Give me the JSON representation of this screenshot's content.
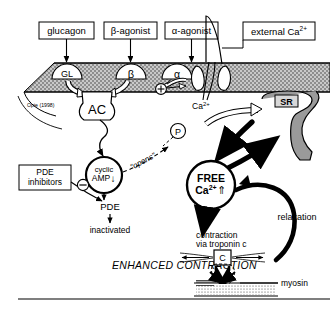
{
  "figure": {
    "title_inline": "ENHANCED CONTRACTION",
    "attribution": "Opie (1998)"
  },
  "ligand_boxes": [
    {
      "label": "glucagon"
    },
    {
      "label": "β-agonist"
    },
    {
      "label": "α-agonist"
    },
    {
      "label": "external Ca2+"
    }
  ],
  "receptors": [
    {
      "label": "GL"
    },
    {
      "label": "β"
    },
    {
      "label": "α"
    }
  ],
  "signs": {
    "plus": "⊕",
    "minus": "⊖"
  },
  "nodes": {
    "adenylate_cyclase": "AC",
    "cyclic_amp_line1": "cyclic",
    "cyclic_amp_line2": "AMP",
    "cyclic_amp_arrow": "↓",
    "phosphate": "P",
    "opens": "\"opens\"",
    "calcium_label": "Ca2+",
    "sr": "SR",
    "free_ca_line1": "FREE",
    "free_ca_line2": "Ca2+",
    "free_ca_arrow": "⇑",
    "troponin": "C"
  },
  "pde_path": {
    "inhibitors_line1": "PDE",
    "inhibitors_line2": "inhibitors",
    "pde": "PDE",
    "inactivated": "inactivated"
  },
  "annotations": {
    "relaxation": "relaxation",
    "contraction_line1": "contraction",
    "contraction_line2": "via troponin c",
    "myosin": "myosin"
  },
  "colors": {
    "membrane_fill": "#b3b3b3",
    "sr_fill": "#9a9a9a",
    "stroke": "#000000",
    "background": "#ffffff"
  }
}
